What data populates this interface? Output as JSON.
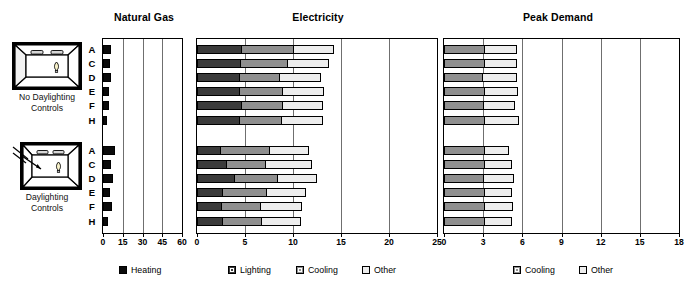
{
  "charts": [
    {
      "id": "natural-gas",
      "title": "Natural Gas",
      "axis": {
        "min": 0,
        "max": 60,
        "ticks": [
          0,
          15,
          30,
          45,
          60
        ]
      }
    },
    {
      "id": "electricity",
      "title": "Electricity",
      "axis": {
        "min": 0,
        "max": 25,
        "ticks": [
          0,
          5,
          10,
          15,
          20,
          25
        ]
      }
    },
    {
      "id": "peak-demand",
      "title": "Peak Demand",
      "axis": {
        "min": 0,
        "max": 18,
        "ticks": [
          0,
          3,
          6,
          9,
          12,
          15,
          18
        ]
      }
    }
  ],
  "groups": [
    {
      "id": "no-daylighting",
      "caption_line1": "No Daylighting",
      "caption_line2": "Controls",
      "icon": "room-no-daylighting-icon"
    },
    {
      "id": "daylighting",
      "caption_line1": "Daylighting",
      "caption_line2": "Controls",
      "icon": "room-daylighting-icon"
    }
  ],
  "row_labels": [
    "A",
    "C",
    "D",
    "E",
    "F",
    "H"
  ],
  "legend": {
    "left": [
      {
        "label": "Heating",
        "color": "#0b0b0b",
        "name": "legend-heating"
      }
    ],
    "middle": [
      {
        "label": "Lighting",
        "color": "#3b3b3b",
        "name": "legend-lighting"
      },
      {
        "label": "Cooling",
        "color": "#8f8f8f",
        "name": "legend-cooling"
      },
      {
        "label": "Other",
        "color": "#ededed",
        "name": "legend-other"
      }
    ],
    "right": [
      {
        "label": "Cooling",
        "color": "#8f8f8f",
        "name": "legend-peak-cooling"
      },
      {
        "label": "Other",
        "color": "#ededed",
        "name": "legend-peak-other"
      }
    ]
  },
  "chart_data": [
    {
      "type": "bar",
      "orientation": "horizontal",
      "stacked": true,
      "title": "Natural Gas",
      "xlabel": "",
      "ylabel": "",
      "xlim": [
        0,
        60
      ],
      "xticks": [
        0,
        15,
        30,
        45,
        60
      ],
      "grid": true,
      "legend_position": "bottom",
      "series": [
        {
          "name": "Heating",
          "color": "#0b0b0b"
        }
      ],
      "groups": [
        {
          "name": "No Daylighting Controls",
          "categories": [
            "A",
            "C",
            "D",
            "E",
            "F",
            "H"
          ],
          "values": {
            "Heating": [
              5.6,
              4.9,
              5.6,
              3.8,
              3.8,
              2.6
            ]
          }
        },
        {
          "name": "Daylighting Controls",
          "categories": [
            "A",
            "C",
            "D",
            "E",
            "F",
            "H"
          ],
          "values": {
            "Heating": [
              8.3,
              5.6,
              7.1,
              4.9,
              6.0,
              3.0
            ]
          }
        }
      ]
    },
    {
      "type": "bar",
      "orientation": "horizontal",
      "stacked": true,
      "title": "Electricity",
      "xlabel": "",
      "ylabel": "",
      "xlim": [
        0,
        25
      ],
      "xticks": [
        0,
        5,
        10,
        15,
        20,
        25
      ],
      "grid": true,
      "legend_position": "bottom",
      "series": [
        {
          "name": "Lighting",
          "color": "#3b3b3b"
        },
        {
          "name": "Cooling",
          "color": "#8f8f8f"
        },
        {
          "name": "Other",
          "color": "#ededed"
        }
      ],
      "groups": [
        {
          "name": "No Daylighting Controls",
          "categories": [
            "A",
            "C",
            "D",
            "E",
            "F",
            "H"
          ],
          "values": {
            "Lighting": [
              4.6,
              4.5,
              4.4,
              4.4,
              4.6,
              4.4
            ],
            "Cooling": [
              5.4,
              4.9,
              4.1,
              4.5,
              4.3,
              4.3
            ],
            "Other": [
              4.2,
              4.2,
              4.3,
              4.2,
              4.1,
              4.3
            ]
          }
        },
        {
          "name": "Daylighting Controls",
          "categories": [
            "A",
            "C",
            "D",
            "E",
            "F",
            "H"
          ],
          "values": {
            "Lighting": [
              2.4,
              3.0,
              3.9,
              2.6,
              2.5,
              2.6
            ],
            "Cooling": [
              5.1,
              4.1,
              4.4,
              4.6,
              4.1,
              4.1
            ],
            "Other": [
              4.1,
              4.8,
              4.1,
              4.1,
              4.2,
              4.0
            ]
          }
        }
      ]
    },
    {
      "type": "bar",
      "orientation": "horizontal",
      "stacked": true,
      "title": "Peak Demand",
      "xlabel": "",
      "ylabel": "",
      "xlim": [
        0,
        18
      ],
      "xticks": [
        0,
        3,
        6,
        9,
        12,
        15,
        18
      ],
      "grid": true,
      "legend_position": "bottom",
      "series": [
        {
          "name": "Cooling",
          "color": "#8f8f8f"
        },
        {
          "name": "Other",
          "color": "#ededed"
        }
      ],
      "groups": [
        {
          "name": "No Daylighting Controls",
          "categories": [
            "A",
            "C",
            "D",
            "E",
            "F",
            "H"
          ],
          "values": {
            "Cooling": [
              3.1,
              3.1,
              2.9,
              3.1,
              3.0,
              3.1
            ],
            "Other": [
              2.4,
              2.4,
              2.6,
              2.5,
              2.4,
              2.6
            ]
          }
        },
        {
          "name": "Daylighting Controls",
          "categories": [
            "A",
            "C",
            "D",
            "E",
            "F",
            "H"
          ],
          "values": {
            "Cooling": [
              3.1,
              3.1,
              3.0,
              3.1,
              3.1,
              3.1
            ],
            "Other": [
              1.8,
              2.0,
              2.3,
              2.0,
              2.1,
              2.0
            ]
          }
        }
      ]
    }
  ]
}
